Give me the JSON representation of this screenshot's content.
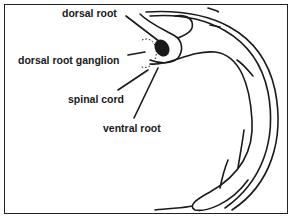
{
  "figure": {
    "type": "anatomical-diagram",
    "labels": [
      {
        "id": "dorsal-root",
        "text": "dorsal root",
        "x": 62,
        "y": 7
      },
      {
        "id": "dorsal-root-ganglion",
        "text": "dorsal root ganglion",
        "x": 18,
        "y": 55
      },
      {
        "id": "spinal-cord",
        "text": "spinal cord",
        "x": 68,
        "y": 93
      },
      {
        "id": "ventral-root",
        "text": "ventral root",
        "x": 103,
        "y": 123
      }
    ],
    "colors": {
      "line": "#1a1a1a",
      "background": "#ffffff",
      "border": "#222222"
    }
  }
}
